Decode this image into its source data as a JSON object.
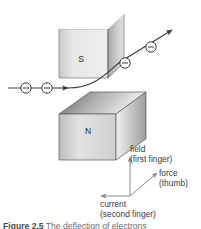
{
  "figure": {
    "caption_prefix": "Figure 2.5",
    "caption_rest": " The deflection of electrons",
    "background_color": "#ffffff"
  },
  "magnets": {
    "south": {
      "pole_label": "S",
      "front_face_color": "#e3e3e3",
      "side_face_color": "#b6b6b6",
      "edge_color": "#6f6f6f"
    },
    "north": {
      "pole_label": "N",
      "front_face_color": "#dcdcdc",
      "top_face_color": "#8f8f8f",
      "side_face_color": "#9a9a9a",
      "edge_color": "#5a5a5a"
    }
  },
  "electron_beam": {
    "particle_symbol": "−",
    "particle_count": 4,
    "line_color": "#3a3a3a",
    "circle_fill": "#ffffff",
    "circle_stroke": "#3a3a3a"
  },
  "axes": {
    "origin_color": "#8a8a8a",
    "field": {
      "label_line1": "field",
      "label_line2": "(first finger)",
      "direction": "up"
    },
    "force": {
      "label_line1": "force",
      "label_line2": "(thumb)",
      "direction": "up-right"
    },
    "current": {
      "label_line1": "current",
      "label_line2": "(second finger)",
      "direction": "left"
    }
  }
}
